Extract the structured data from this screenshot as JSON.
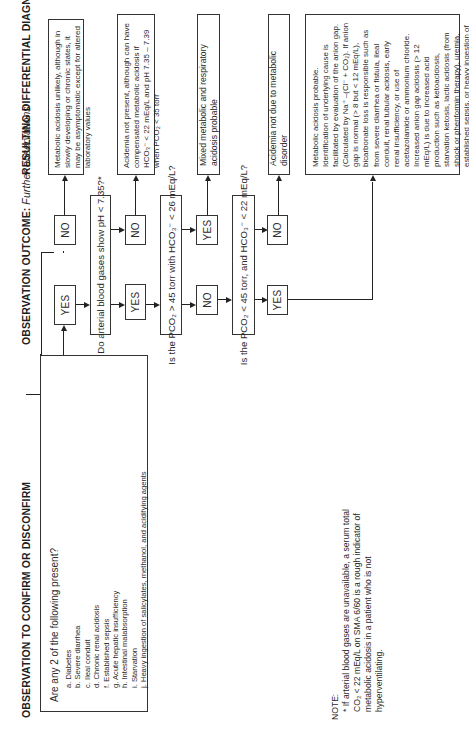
{
  "headers": {
    "observation": "OBSERVATION TO CONFIRM OR DISCONFIRM",
    "outcome": "OBSERVATION OUTCOME:",
    "outcome_sub": "Further observations",
    "diagnosis": "RESULTING DIFFERENTIAL DIAGNOSIS"
  },
  "input_box": {
    "question": "Are any 2 of the following present?",
    "items": [
      "a. Diabetes",
      "b. Severe diarrhea",
      "c. Ileal conduit",
      "d. Chronic renal acidosis",
      "f. Established sepsis",
      "g. Acute hepatic insufficiency",
      "h. Intestinal malabsorption",
      "i. Starvation",
      "j. Heavy ingestion of salicylates, methanol, and acidifying agents"
    ]
  },
  "questions": [
    "Do arterial blood gases show pH < 7.35?*",
    "Is the PCO₂ > 45 torr with HCO₃⁻ < 26 mEq/L?",
    "Is the PCO₂ < 45 torr, and HCO₃⁻ < 22 mEq/L?"
  ],
  "outcomes": {
    "row1": {
      "yes": "YES",
      "no": "NO"
    },
    "row2": {
      "yes": "YES",
      "no": "NO"
    },
    "row3": {
      "no": "NO",
      "yes": "YES"
    },
    "row4": {
      "yes": "YES",
      "no": "NO"
    }
  },
  "results": [
    "Metabolic acidosis unlikely, although in slowly developing or chronic states, it may be asymptomatic except for altered laboratory values",
    "Acidemia not present, although can have compensated metabolic acidosis if HCO₃⁻ < 22 mEq/L and pH 7.35 – 7.39 when PCO₂ < 35 torr",
    "Mixed metabolic and respiratory acidosis probable",
    "Acidemia not due to metabolic disorder",
    "Metabolic acidosis probable. Identification of underlying cause is facilitated by evaluation of the anion gap. (Calculated by Na⁺ –(Cl⁻ + CO₂). If anion gap is normal (> 8 but < 12 mEq/L), bicarbonate loss is responsible such as from severe diarrhea or fistula, ileal conduit, renal tubular acidosis, early renal insufficiency, or use of acetazolamide or ammonium chloride. Increased anion gap acidosis (> 12 mEq/L) is due to increased acid production such as ketoacidosis, starvation ketosis, lactic acidosis (from shock or phenformin therapy), uremia, established sepsis, or heavy ingestion of salicylates, methanol, chloral hydrate, or paraldehyde. Decreased anion gap acidosis (< 8 mEq/L) is usually associated with multiple myeloma."
  ],
  "note": {
    "label": "NOTE:",
    "text": "* If arterial blood gases are unavailable, a serum total CO₂ < 22 mEq/L on SMA 6/60 is a rough indicator of metabolic acidosis in a patient who is not hyperventilating."
  }
}
